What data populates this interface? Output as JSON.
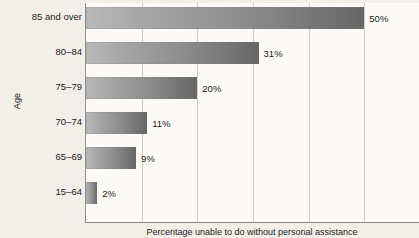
{
  "chart_data": {
    "type": "bar",
    "orientation": "horizontal",
    "title": "",
    "xlabel": "Percentage unable to do without personal assistance",
    "ylabel": "Age",
    "categories": [
      "15–64",
      "65–69",
      "70–74",
      "75–79",
      "80–84",
      "85 and over"
    ],
    "values": [
      2,
      9,
      11,
      20,
      31,
      50
    ],
    "value_labels": [
      "2%",
      "9%",
      "11%",
      "20%",
      "31%",
      "50%"
    ],
    "xlim": [
      0,
      60
    ],
    "ylim": null,
    "grid": "vertical",
    "gridline_values": [
      10,
      20,
      30,
      40,
      50,
      60
    ],
    "legend": null,
    "legend_position": "none",
    "annotations": []
  },
  "style": {
    "background": "#f2efe9",
    "plot_background": "#fbfaf7",
    "axis_color": "#8d8d8d",
    "gridline_color": "#cfccc6",
    "bar_gradient_start": "#b9b9b9",
    "bar_gradient_end": "#666666",
    "text_color": "#1b1b1b"
  }
}
